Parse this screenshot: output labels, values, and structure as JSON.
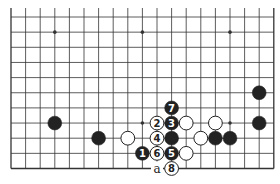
{
  "diagram": {
    "type": "go-board-fragment",
    "board_columns": 19,
    "visible_rows": 11,
    "colors": {
      "black": "#222222",
      "white": "#ffffff",
      "line": "#333333",
      "background": "#ffffff"
    },
    "star_points": [
      {
        "col": 4,
        "row": 10
      },
      {
        "col": 10,
        "row": 10
      },
      {
        "col": 16,
        "row": 10
      },
      {
        "col": 10,
        "row": 4
      },
      {
        "col": 16,
        "row": 4
      }
    ],
    "stones": [
      {
        "color": "black",
        "col": 4,
        "row": 4,
        "label": ""
      },
      {
        "color": "black",
        "col": 7,
        "row": 3,
        "label": ""
      },
      {
        "color": "white",
        "col": 9,
        "row": 3,
        "label": ""
      },
      {
        "color": "white",
        "col": 11,
        "row": 4,
        "label": "2"
      },
      {
        "color": "black",
        "col": 12,
        "row": 4,
        "label": "3"
      },
      {
        "color": "white",
        "col": 13,
        "row": 4,
        "label": ""
      },
      {
        "color": "white",
        "col": 15,
        "row": 4,
        "label": ""
      },
      {
        "color": "black",
        "col": 18,
        "row": 4,
        "label": ""
      },
      {
        "color": "black",
        "col": 18,
        "row": 6,
        "label": ""
      },
      {
        "color": "black",
        "col": 12,
        "row": 5,
        "label": "7"
      },
      {
        "color": "white",
        "col": 11,
        "row": 3,
        "label": "4"
      },
      {
        "color": "black",
        "col": 12,
        "row": 3,
        "label": ""
      },
      {
        "color": "white",
        "col": 14,
        "row": 3,
        "label": ""
      },
      {
        "color": "black",
        "col": 15,
        "row": 3,
        "label": ""
      },
      {
        "color": "black",
        "col": 16,
        "row": 3,
        "label": ""
      },
      {
        "color": "black",
        "col": 10,
        "row": 2,
        "label": "1"
      },
      {
        "color": "white",
        "col": 11,
        "row": 2,
        "label": "6"
      },
      {
        "color": "black",
        "col": 12,
        "row": 2,
        "label": "5"
      },
      {
        "color": "white",
        "col": 13,
        "row": 2,
        "label": ""
      },
      {
        "color": "white",
        "col": 12,
        "row": 1,
        "label": "8"
      }
    ],
    "point_labels": [
      {
        "col": 11,
        "row": 1,
        "text": "a"
      }
    ]
  }
}
